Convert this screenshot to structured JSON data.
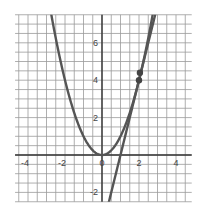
{
  "chart_data": {
    "type": "line",
    "title": "",
    "xlabel": "",
    "ylabel": "",
    "xlim": [
      -4.7,
      4.85
    ],
    "ylim": [
      -2.5,
      7.5
    ],
    "grid": true,
    "grid_step": 0.5,
    "x_ticks": [
      -4,
      -2,
      0,
      2,
      4
    ],
    "x_tick_labels": [
      "-4",
      "-2",
      "0",
      "2",
      "4"
    ],
    "y_ticks": [
      -2,
      2,
      4,
      6
    ],
    "y_tick_labels": [
      "-2",
      "2",
      "4",
      "6"
    ],
    "series": [
      {
        "name": "parabola y = x^2",
        "kind": "function",
        "expr": "x^2",
        "color": "#555555"
      },
      {
        "name": "tangent line y = 4x - 4",
        "kind": "function",
        "expr": "4x-4",
        "color": "#555555"
      }
    ],
    "points": [
      {
        "x": 2,
        "y": 4,
        "label": ""
      },
      {
        "x": 2.05,
        "y": 4.4,
        "label": ""
      }
    ],
    "legend": null
  },
  "colors": {
    "grid": "#9a9a9a",
    "axis": "#333333",
    "curve": "#555555",
    "point": "#444444",
    "background": "#ffffff"
  }
}
